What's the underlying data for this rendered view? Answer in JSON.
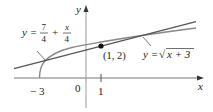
{
  "figure": {
    "axes": {
      "x_label": "x",
      "y_label": "y",
      "origin_label": "0",
      "ticks": [
        {
          "value": -3,
          "label": "− 3"
        },
        {
          "value": 1,
          "label": "1"
        }
      ]
    },
    "curves": [
      {
        "name": "tangent-line",
        "equation": "y = 7/4 + x/4",
        "label_lhs": "y =",
        "label_frac1_num": "7",
        "label_frac1_den": "4",
        "label_plus": "+",
        "label_frac2_num": "x",
        "label_frac2_den": "4",
        "color": "#555555"
      },
      {
        "name": "sqrt-curve",
        "equation": "y = √(x + 3)",
        "label_lhs": "y =",
        "label_radical": "√",
        "label_radicand": "x + 3",
        "color": "#888888"
      }
    ],
    "point": {
      "label": "(1, 2)",
      "x": 1,
      "y": 2
    }
  }
}
